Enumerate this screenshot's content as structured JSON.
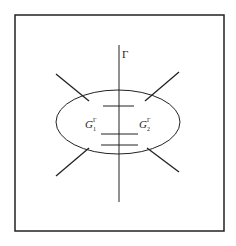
{
  "diagram": {
    "axis_label": "Γ",
    "left_label": {
      "base": "G",
      "sub": "1",
      "sup": "Γ"
    },
    "right_label": {
      "base": "G",
      "sub": "2",
      "sup": "Γ"
    },
    "colors": {
      "stroke": "#222222",
      "background": "#ffffff"
    }
  }
}
